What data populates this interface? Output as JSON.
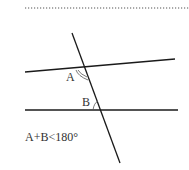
{
  "diagram": {
    "labels": {
      "angle_a": "A",
      "angle_b": "B",
      "condition": "A+B<180°"
    },
    "colors": {
      "line": "#1a1a1a",
      "text": "#333333",
      "dotted_rule": "#555555"
    }
  }
}
